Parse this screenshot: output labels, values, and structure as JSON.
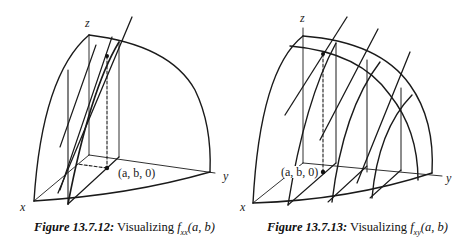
{
  "figures": [
    {
      "id": "13.7.12",
      "caption": {
        "number": "Figure 13.7.12:",
        "text": " Visualizing ",
        "function": "f",
        "subscript": "xx",
        "args": "(a, b)"
      },
      "axis_labels": {
        "x": "x",
        "y": "y",
        "z": "z"
      },
      "point_label": "(a, b, 0)"
    },
    {
      "id": "13.7.13",
      "caption": {
        "number": "Figure 13.7.13:",
        "text": " Visualizing ",
        "function": "f",
        "subscript": "xy",
        "args": "(a, b)"
      },
      "axis_labels": {
        "x": "x",
        "y": "y",
        "z": "z"
      },
      "point_label": "(a, b, 0)"
    }
  ]
}
